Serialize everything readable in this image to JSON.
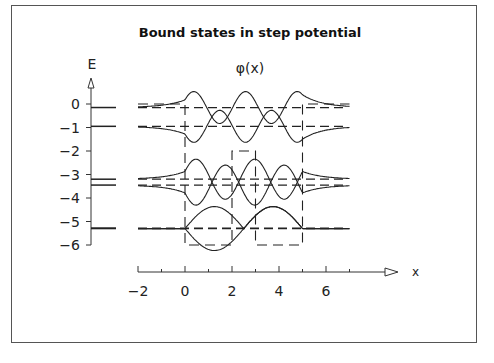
{
  "chart_data": {
    "type": "line",
    "title": "Bound states in step potential",
    "subtitle": "φ(x)",
    "xlabel": "x",
    "ylabel": "E",
    "x_ticks": [
      -2,
      0,
      2,
      4,
      6
    ],
    "x_minor_ticks": [
      -1,
      1,
      3,
      5,
      7
    ],
    "y_ticks": [
      0,
      -1,
      -2,
      -3,
      -4,
      -5,
      -6
    ],
    "xlim": [
      -2,
      7.5
    ],
    "ylim": [
      -6,
      0.5
    ],
    "grid": false,
    "potential": {
      "description": "Step potential: V=0 outside [0,5]; V=-6 on [0,2] and [3,5]; V=-2 on [2,3]",
      "x": [
        -2,
        0,
        0,
        2,
        2,
        3,
        3,
        5,
        5,
        7
      ],
      "V": [
        0,
        0,
        -6,
        -6,
        -2,
        -2,
        -6,
        -6,
        0,
        0
      ]
    },
    "energy_levels": [
      {
        "n": 1,
        "E": -5.3
      },
      {
        "n": 2,
        "E": -5.28
      },
      {
        "n": 3,
        "E": -3.45
      },
      {
        "n": 4,
        "E": -3.2
      },
      {
        "n": 5,
        "E": -0.95
      },
      {
        "n": 6,
        "E": -0.15
      }
    ],
    "series": [
      {
        "name": "φ1,φ2 (E≈-5.3)",
        "baseline": -5.3,
        "note": "pair of near-degenerate states, symmetric/antisymmetric lobes in two wells"
      },
      {
        "name": "φ3,φ4 (E≈-3.2/-3.45)",
        "baseline": -3.3,
        "note": "one node per well"
      },
      {
        "name": "φ5,φ6 (E≈-0.95/-0.15)",
        "baseline": -0.55,
        "note": "two nodes per well, decaying tails outside"
      }
    ]
  },
  "labels": {
    "title": "Bound states in step potential",
    "phi": "φ(x)",
    "e_axis": "E",
    "x_axis": "x",
    "y_ticks": [
      "0",
      "−1",
      "−2",
      "−3",
      "−4",
      "−5",
      "−6"
    ],
    "x_ticks": [
      "−2",
      "0",
      "2",
      "4",
      "6"
    ]
  }
}
